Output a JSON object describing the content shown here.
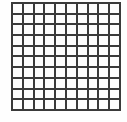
{
  "figure": {
    "name": "square-grid",
    "rows": 10,
    "columns": 10,
    "total_cells": 100,
    "line_color": "#3a3a3a",
    "cell_fill_color": "#fdfdfd",
    "background_color": "#ffffff",
    "line_width_px": 2,
    "border_width_px": 2,
    "geometry": {
      "left_px": 11,
      "top_px": 2,
      "width_px": 110,
      "height_px": 109,
      "cell_width_px": 9,
      "cell_height_px": 8.9
    }
  },
  "chart_data": {
    "type": "heatmap",
    "title": "",
    "xlabel": "",
    "ylabel": "",
    "rows": 10,
    "columns": 10,
    "x": [
      1,
      2,
      3,
      4,
      5,
      6,
      7,
      8,
      9,
      10
    ],
    "y": [
      1,
      2,
      3,
      4,
      5,
      6,
      7,
      8,
      9,
      10
    ],
    "values": [
      [
        0,
        0,
        0,
        0,
        0,
        0,
        0,
        0,
        0,
        0
      ],
      [
        0,
        0,
        0,
        0,
        0,
        0,
        0,
        0,
        0,
        0
      ],
      [
        0,
        0,
        0,
        0,
        0,
        0,
        0,
        0,
        0,
        0
      ],
      [
        0,
        0,
        0,
        0,
        0,
        0,
        0,
        0,
        0,
        0
      ],
      [
        0,
        0,
        0,
        0,
        0,
        0,
        0,
        0,
        0,
        0
      ],
      [
        0,
        0,
        0,
        0,
        0,
        0,
        0,
        0,
        0,
        0
      ],
      [
        0,
        0,
        0,
        0,
        0,
        0,
        0,
        0,
        0,
        0
      ],
      [
        0,
        0,
        0,
        0,
        0,
        0,
        0,
        0,
        0,
        0
      ],
      [
        0,
        0,
        0,
        0,
        0,
        0,
        0,
        0,
        0,
        0
      ],
      [
        0,
        0,
        0,
        0,
        0,
        0,
        0,
        0,
        0,
        0
      ]
    ],
    "grid": true,
    "legend": false,
    "tick_labels_x": [],
    "tick_labels_y": [],
    "annotations": []
  }
}
